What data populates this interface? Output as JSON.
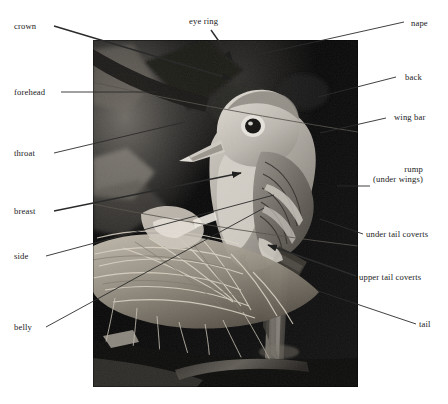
{
  "figure": {
    "photo": {
      "name": "photo-of-bird-at-nest",
      "description": "Black and white photograph of a small flycatcher perched beside a twig nest",
      "frame": {
        "x": 93,
        "y": 40,
        "width": 265,
        "height": 347
      }
    },
    "line_color": "#2b2b2b",
    "text_color": "#1a1a1a",
    "background": "#ffffff"
  },
  "labels": [
    {
      "id": "crown",
      "text": "crown",
      "align": "left",
      "x": 14,
      "y": 21
    },
    {
      "id": "eye-ring",
      "text": "eye ring",
      "align": "center",
      "x": 189,
      "y": 16
    },
    {
      "id": "nape",
      "text": "nape",
      "align": "right",
      "x": 411,
      "y": 18
    },
    {
      "id": "back",
      "text": "back",
      "align": "right",
      "x": 405,
      "y": 72
    },
    {
      "id": "forehead",
      "text": "forehead",
      "align": "left",
      "x": 14,
      "y": 87
    },
    {
      "id": "wing-bar",
      "text": "wing bar",
      "align": "right",
      "x": 394,
      "y": 112
    },
    {
      "id": "throat",
      "text": "throat",
      "align": "left",
      "x": 14,
      "y": 148
    },
    {
      "id": "rump",
      "text": "rump",
      "line2": "(under wings)",
      "align": "right",
      "x": 373,
      "y": 164
    },
    {
      "id": "breast",
      "text": "breast",
      "align": "left",
      "x": 14,
      "y": 206
    },
    {
      "id": "under-tail-coverts",
      "text": "under tail coverts",
      "align": "left",
      "x": 366,
      "y": 229
    },
    {
      "id": "side",
      "text": "side",
      "align": "left",
      "x": 14,
      "y": 251
    },
    {
      "id": "upper-tail-coverts",
      "text": "upper tail coverts",
      "align": "left",
      "x": 359,
      "y": 272
    },
    {
      "id": "tail",
      "text": "tail",
      "align": "left",
      "x": 419,
      "y": 319
    },
    {
      "id": "belly",
      "text": "belly",
      "align": "left",
      "x": 14,
      "y": 322
    }
  ],
  "leader_lines": [
    {
      "id": "crown-leader",
      "x1": 54,
      "y1": 26,
      "x2": 231,
      "y2": 79,
      "arrow": true
    },
    {
      "id": "eye-ring-leader",
      "x1": 211,
      "y1": 30,
      "x2": 232,
      "y2": 60,
      "arrow": true
    },
    {
      "id": "nape-leader",
      "x1": 404,
      "y1": 22,
      "x2": 243,
      "y2": 58,
      "arrow": false
    },
    {
      "id": "back-leader",
      "x1": 396,
      "y1": 77,
      "x2": 318,
      "y2": 97,
      "arrow": false
    },
    {
      "id": "forehead-leader",
      "x1": 61,
      "y1": 92,
      "x2": 157,
      "y2": 92,
      "arrow": false
    },
    {
      "id": "wing-bar-leader",
      "x1": 386,
      "y1": 118,
      "x2": 320,
      "y2": 133,
      "arrow": false
    },
    {
      "id": "throat-leader",
      "x1": 54,
      "y1": 153,
      "x2": 185,
      "y2": 122,
      "arrow": false
    },
    {
      "id": "rump-leader",
      "x1": 370,
      "y1": 186,
      "x2": 337,
      "y2": 186,
      "arrow": false
    },
    {
      "id": "breast-leader",
      "x1": 54,
      "y1": 211,
      "x2": 241,
      "y2": 173,
      "arrow": true
    },
    {
      "id": "under-tail-coverts-leader",
      "x1": 363,
      "y1": 234,
      "x2": 320,
      "y2": 219,
      "arrow": false
    },
    {
      "id": "side-leader",
      "x1": 46,
      "y1": 256,
      "x2": 274,
      "y2": 195,
      "arrow": false
    },
    {
      "id": "upper-tail-coverts-leader",
      "x1": 356,
      "y1": 276,
      "x2": 268,
      "y2": 245,
      "arrow": true
    },
    {
      "id": "tail-leader",
      "x1": 416,
      "y1": 324,
      "x2": 318,
      "y2": 291,
      "arrow": false
    },
    {
      "id": "belly-leader",
      "x1": 46,
      "y1": 327,
      "x2": 264,
      "y2": 208,
      "arrow": false
    }
  ]
}
